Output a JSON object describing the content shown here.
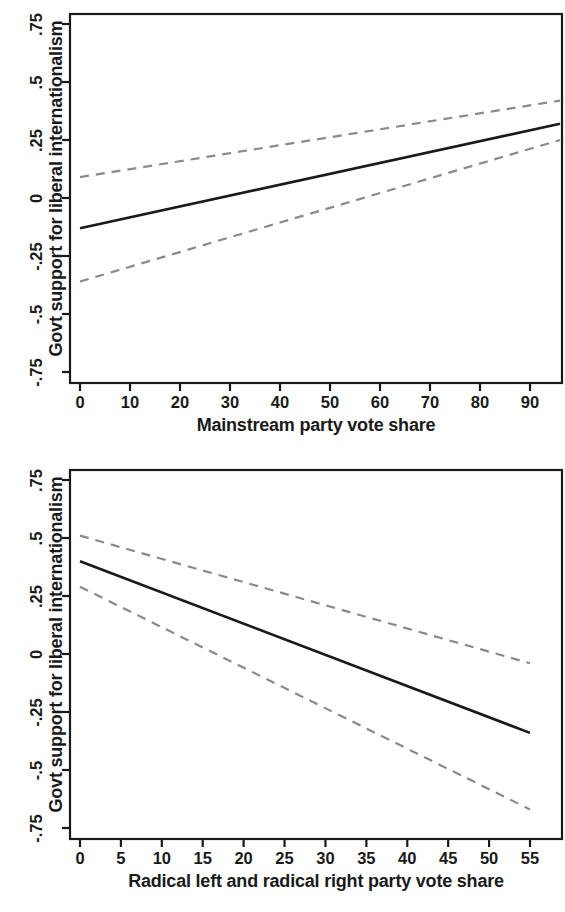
{
  "figure": {
    "background": "#ffffff",
    "line_color": "#1a1a1a",
    "ci_color": "#8a8a8a"
  },
  "panels": [
    {
      "id": "mainstream",
      "ylabel": "Govt support for liberal internationalism",
      "xlabel": "Mainstream party vote share",
      "xticks": [
        "0",
        "10",
        "20",
        "30",
        "40",
        "50",
        "60",
        "70",
        "80",
        "90"
      ],
      "yticks": [
        ".75",
        ".5",
        ".25",
        "0",
        "-.25",
        "-.5",
        "-.75"
      ]
    },
    {
      "id": "radical",
      "ylabel": "Govt support for liberal internationalism",
      "xlabel": "Radical left and radical right party vote share",
      "xticks": [
        "0",
        "5",
        "10",
        "15",
        "20",
        "25",
        "30",
        "35",
        "40",
        "45",
        "50",
        "55"
      ],
      "yticks": [
        ".75",
        ".5",
        ".25",
        "0",
        "-.25",
        "-.5",
        "-.75"
      ]
    }
  ],
  "chart_data": [
    {
      "type": "line",
      "title": "",
      "xlabel": "Mainstream party vote share",
      "ylabel": "Govt support for liberal internationalism",
      "xlim": [
        0,
        96
      ],
      "ylim": [
        -0.75,
        0.75
      ],
      "xticks": [
        0,
        10,
        20,
        30,
        40,
        50,
        60,
        70,
        80,
        90
      ],
      "yticks": [
        0.75,
        0.5,
        0.25,
        0,
        -0.25,
        -0.5,
        -0.75
      ],
      "grid": false,
      "legend": "none",
      "series": [
        {
          "name": "Predicted marginal effect",
          "style": "solid",
          "color": "#1a1a1a",
          "x": [
            0,
            96
          ],
          "values": [
            -0.13,
            0.32
          ]
        },
        {
          "name": "95% CI upper",
          "style": "dashed",
          "color": "#8a8a8a",
          "x": [
            0,
            96
          ],
          "values": [
            0.09,
            0.42
          ]
        },
        {
          "name": "95% CI lower",
          "style": "dashed",
          "color": "#8a8a8a",
          "x": [
            0,
            96
          ],
          "values": [
            -0.36,
            0.25
          ]
        }
      ]
    },
    {
      "type": "line",
      "title": "",
      "xlabel": "Radical left and radical right party vote share",
      "ylabel": "Govt support for liberal internationalism",
      "xlim": [
        0,
        55
      ],
      "ylim": [
        -0.75,
        0.75
      ],
      "xticks": [
        0,
        5,
        10,
        15,
        20,
        25,
        30,
        35,
        40,
        45,
        50,
        55
      ],
      "yticks": [
        0.75,
        0.5,
        0.25,
        0,
        -0.25,
        -0.5,
        -0.75
      ],
      "grid": false,
      "legend": "none",
      "series": [
        {
          "name": "Predicted marginal effect",
          "style": "solid",
          "color": "#1a1a1a",
          "x": [
            0,
            55
          ],
          "values": [
            0.4,
            -0.34
          ]
        },
        {
          "name": "95% CI upper",
          "style": "dashed",
          "color": "#8a8a8a",
          "x": [
            0,
            55
          ],
          "values": [
            0.51,
            -0.04
          ]
        },
        {
          "name": "95% CI lower",
          "style": "dashed",
          "color": "#8a8a8a",
          "x": [
            0,
            55
          ],
          "values": [
            0.29,
            -0.67
          ]
        }
      ]
    }
  ]
}
